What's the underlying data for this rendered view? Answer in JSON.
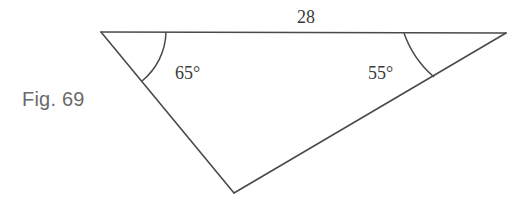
{
  "figure": {
    "caption": "Fig. 69",
    "type": "triangle",
    "side_label_top": "28",
    "angle_left_label": "65°",
    "angle_right_label": "55°",
    "stroke_color": "#4a4a4a",
    "caption_color": "#6a6a6a"
  }
}
